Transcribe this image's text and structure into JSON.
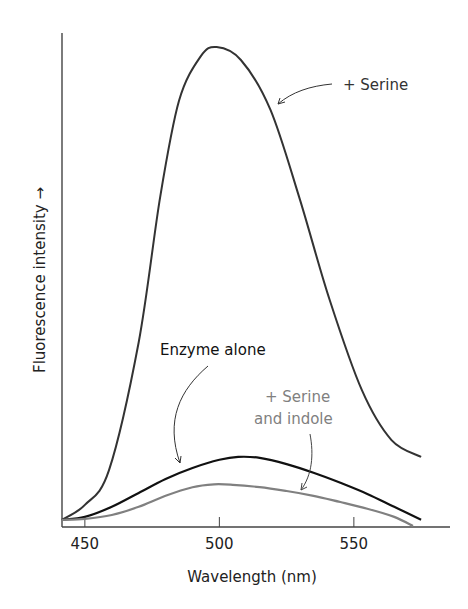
{
  "chart_data": {
    "type": "line",
    "title": "",
    "xlabel": "Wavelength (nm)",
    "ylabel": "Fluorescence intensity →",
    "xlim": [
      441.5,
      586
    ],
    "ylim": [
      0,
      102
    ],
    "x_ticks": [
      450,
      500,
      550
    ],
    "y_ticks": [],
    "grid": false,
    "legend": "inline annotations with arrows",
    "series": [
      {
        "name": "+ Serine",
        "color": "#333333",
        "x": [
          441.5,
          450,
          459,
          470,
          478,
          485,
          493,
          499,
          508,
          519,
          530,
          541,
          553,
          564,
          575
        ],
        "values": [
          1.5,
          4.6,
          11.9,
          38.5,
          68.8,
          88.8,
          98,
          100,
          97.3,
          86.9,
          68.1,
          47.3,
          28.5,
          18.1,
          14.6
        ]
      },
      {
        "name": "Enzyme alone",
        "color": "#111111",
        "x": [
          441.5,
          450,
          460,
          470,
          480,
          490,
          500,
          507,
          515,
          525,
          535,
          545,
          555,
          565,
          575
        ],
        "values": [
          1.5,
          2.1,
          4.2,
          7.1,
          10,
          12.3,
          14,
          14.6,
          14.4,
          13.1,
          11.3,
          9.2,
          6.9,
          4.2,
          1.5
        ]
      },
      {
        "name": "+ Serine and indole",
        "color": "#808080",
        "x": [
          441.5,
          450,
          460,
          470,
          480,
          490,
          498,
          505,
          515,
          525,
          535,
          545,
          555,
          565,
          572
        ],
        "values": [
          1.5,
          1.7,
          2.5,
          4.2,
          6.5,
          8.3,
          8.9,
          8.8,
          8.3,
          7.5,
          6.5,
          5.2,
          3.8,
          2.1,
          0.2
        ]
      }
    ],
    "annotations": [
      {
        "text": "+ Serine",
        "color": "#333333"
      },
      {
        "text": "Enzyme alone",
        "color": "#111111"
      },
      {
        "text": "+ Serine",
        "color": "#808080"
      },
      {
        "text": "and indole",
        "color": "#808080"
      }
    ]
  }
}
